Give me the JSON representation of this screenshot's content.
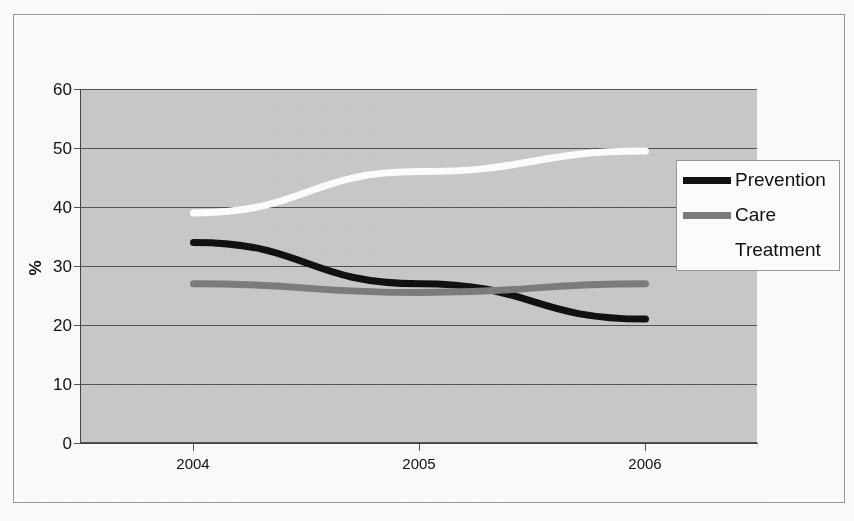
{
  "figure": {
    "kind": "scanned-line-chart",
    "axis_label_y": "%",
    "border_color": "#9a9a9a",
    "plot_bg": "#cfcfcf"
  },
  "chart_data": {
    "type": "line",
    "title": "",
    "subtitle": "",
    "xlabel": "",
    "ylabel": "%",
    "categories": [
      "2004",
      "2005",
      "2006"
    ],
    "x": [
      2004,
      2005,
      2006
    ],
    "ylim": [
      0,
      60
    ],
    "yticks": [
      0,
      10,
      20,
      30,
      40,
      50,
      60
    ],
    "ytick_labels": [
      "0",
      "10",
      "20",
      "30",
      "40",
      "50",
      "60"
    ],
    "grid": true,
    "legend_position": "top-right",
    "series": [
      {
        "name": "Prevention",
        "color": "#111111",
        "values": [
          34,
          27,
          21
        ]
      },
      {
        "name": "Care",
        "color": "#7d7d7d",
        "values": [
          27,
          25.5,
          27
        ]
      },
      {
        "name": "Treatment",
        "color": "#ffffff",
        "values": [
          39,
          46,
          49.5
        ]
      }
    ]
  },
  "legend": {
    "entries": [
      {
        "label": "Prevention",
        "color": "#111111"
      },
      {
        "label": "Care",
        "color": "#7d7d7d"
      },
      {
        "label": "Treatment",
        "color": "#ffffff"
      }
    ]
  }
}
